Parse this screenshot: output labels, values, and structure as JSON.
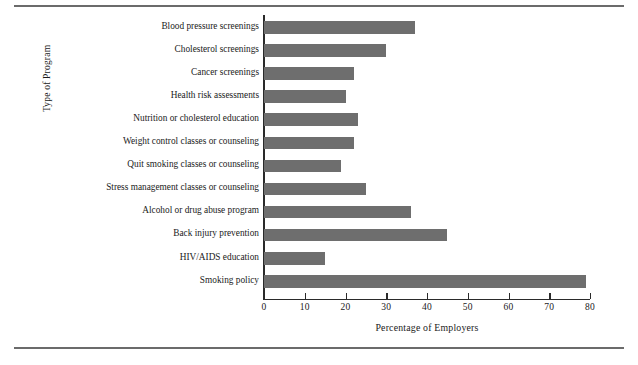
{
  "chart_data": {
    "type": "bar",
    "orientation": "horizontal",
    "title": "",
    "xlabel": "Percentage of Employers",
    "ylabel": "Type of Program",
    "xlim": [
      0,
      80
    ],
    "xticks": [
      "0",
      "10",
      "20",
      "30",
      "40",
      "50",
      "60",
      "70",
      "80"
    ],
    "xtick_values": [
      0,
      10,
      20,
      30,
      40,
      50,
      60,
      70,
      80
    ],
    "grid": false,
    "legend": "none",
    "bar_color": "#6e6e6e",
    "axis_color": "#2a2a2a",
    "rule_color": "#6b6b6b",
    "categories": [
      "Blood pressure screenings",
      "Cholesterol screenings",
      "Cancer screenings",
      "Health risk assessments",
      "Nutrition or cholesterol education",
      "Weight control classes or counseling",
      "Quit smoking classes or counseling",
      "Stress management classes or counseling",
      "Alcohol or drug abuse program",
      "Back injury prevention",
      "HIV/AIDS education",
      "Smoking policy"
    ],
    "values": [
      37,
      30,
      22,
      20,
      23,
      22,
      19,
      25,
      36,
      45,
      15,
      79
    ]
  }
}
